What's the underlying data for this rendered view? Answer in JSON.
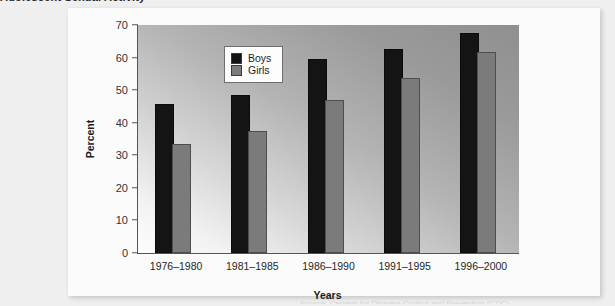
{
  "page": {
    "clipped_heading": "Adolescent Sexual Activity",
    "background_color": "#efefef",
    "card_color": "#fbfbfb",
    "footer_artifact": "Source: Centers for Disease Control and Prevention (CDC)"
  },
  "legend": {
    "position": "top-left-inside-plot",
    "entries": [
      {
        "label": "Boys",
        "color": "#141414"
      },
      {
        "label": "Girls",
        "color": "#7b7b7b"
      }
    ]
  },
  "axes": {
    "x_title": "Years",
    "y_title": "Percent",
    "y_ticks": [
      "70",
      "60",
      "50",
      "40",
      "30",
      "20",
      "10",
      "0"
    ]
  },
  "chart_data": {
    "type": "bar",
    "title": "",
    "subtitle": "",
    "xlabel": "Years",
    "ylabel": "Percent",
    "ylim": [
      0,
      70
    ],
    "ytick_interval": 10,
    "grid": false,
    "legend_position": "upper left",
    "categories": [
      "1976–1980",
      "1981–1985",
      "1986–1990",
      "1991–1995",
      "1996–2000"
    ],
    "series": [
      {
        "name": "Boys",
        "color": "#141414",
        "values": [
          45,
          48,
          59,
          62,
          67
        ]
      },
      {
        "name": "Girls",
        "color": "#7b7b7b",
        "values": [
          33,
          37,
          46.5,
          53,
          61
        ]
      }
    ]
  }
}
